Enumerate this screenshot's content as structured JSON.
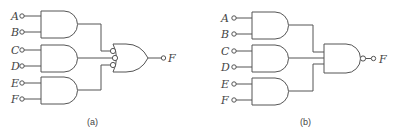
{
  "diagrams": [
    {
      "caption": "(a)",
      "inputs": [
        "A",
        "B",
        "C",
        "D",
        "E",
        "F"
      ],
      "first_stage": "AND",
      "second_stage": "OR with inverted inputs",
      "output": "F"
    },
    {
      "caption": "(b)",
      "inputs": [
        "A",
        "B",
        "C",
        "D",
        "E",
        "F"
      ],
      "first_stage": "AND",
      "second_stage": "NAND",
      "output": "F"
    }
  ]
}
